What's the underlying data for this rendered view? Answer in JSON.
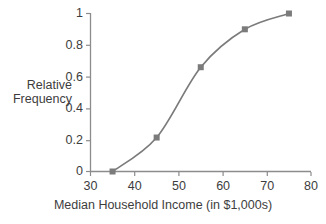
{
  "chart_data": {
    "type": "line",
    "title": "",
    "subtitle": "",
    "xlabel": "Median Household Income (in $1,000s)",
    "ylabel": "Relative Frequency",
    "ylabel_lines": [
      "Relative",
      "Frequency"
    ],
    "x": [
      35,
      45,
      55,
      65,
      75
    ],
    "values": [
      0,
      0.215,
      0.66,
      0.9,
      1
    ],
    "series": [
      {
        "name": "Relative Frequency",
        "x": [
          35,
          45,
          55,
          65,
          75
        ],
        "values": [
          0,
          0.215,
          0.66,
          0.9,
          1
        ]
      }
    ],
    "xlim": [
      30,
      80
    ],
    "ylim": [
      0,
      1
    ],
    "xticks": [
      30,
      40,
      50,
      60,
      70,
      80
    ],
    "xtick_labels": [
      "30",
      "40",
      "50",
      "60",
      "70",
      "80"
    ],
    "yticks": [
      0,
      0.2,
      0.4,
      0.6,
      0.8,
      1
    ],
    "ytick_labels": [
      "0",
      "0.2",
      "0.4",
      "0.6",
      "0.8",
      "1"
    ],
    "grid": false,
    "legend": "none",
    "marker": "square",
    "curve": "smooth",
    "colors": {
      "line": "#7b7b7b",
      "marker": "#7b7b7b",
      "axis": "#8c8c8c",
      "text": "#3d3d3d",
      "background": "#ffffff"
    }
  }
}
